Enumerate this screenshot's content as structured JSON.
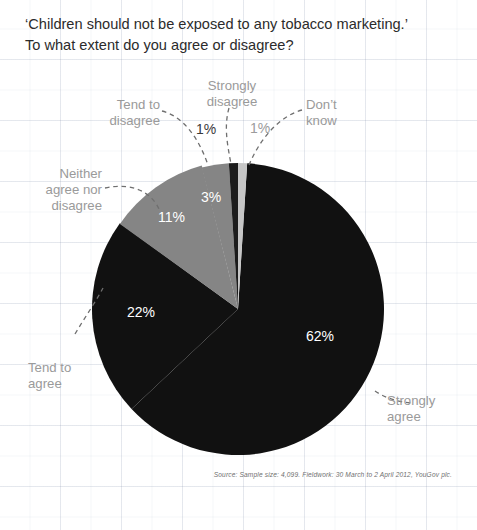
{
  "figure": {
    "width": 477,
    "height": 530,
    "background_color": "#ffffff",
    "grid_visible": true
  },
  "title": {
    "line1": "‘Children should not be exposed to any tobacco marketing.’",
    "line2": "To what extent do you agree or disagree?"
  },
  "source": {
    "text": "Source: Sample size: 4,099. Fieldwork: 30 March to 2 April 2012, YouGov plc."
  },
  "labels": {
    "strongly_disagree_l1": "Strongly",
    "strongly_disagree_l2": "disagree",
    "tend_to_disagree_l1": "Tend to",
    "tend_to_disagree_l2": "disagree",
    "dont_know_l1": "Don’t",
    "dont_know_l2": "know",
    "neither_l1": "Neither",
    "neither_l2": "agree nor",
    "neither_l3": "disagree",
    "tend_to_agree_l1": "Tend to",
    "tend_to_agree_l2": "agree",
    "strongly_agree_l1": "Strongly",
    "strongly_agree_l2": "agree"
  },
  "percent_labels": {
    "strongly_agree": "62%",
    "tend_to_agree": "22%",
    "neither": "11%",
    "tend_to_disagree": "3%",
    "strongly_disagree": "1%",
    "dont_know": "1%"
  },
  "chart_data": {
    "type": "pie",
    "title": "‘Children should not be exposed to any tobacco marketing.’ To what extent do you agree or disagree?",
    "xlabel": "",
    "ylabel": "",
    "legend_position": "none",
    "grid": true,
    "units": "percent",
    "start_angle_deg": 0,
    "direction": "clockwise",
    "center": {
      "x": 238,
      "y": 309
    },
    "radius": 146,
    "categories": [
      "Don’t know",
      "Strongly agree",
      "Tend to agree",
      "Neither agree nor disagree",
      "Tend to disagree",
      "Strongly disagree"
    ],
    "values": [
      1,
      62,
      22,
      11,
      3,
      1
    ],
    "colors": [
      "#c6c6c6",
      "#111111",
      "#111111",
      "#858585",
      "#858585",
      "#1c1c1c"
    ],
    "slices": [
      {
        "label": "Don’t know",
        "value": 1,
        "display": "1%",
        "color": "#c6c6c6",
        "start_deg": 0.0,
        "end_deg": 3.6
      },
      {
        "label": "Strongly agree",
        "value": 62,
        "display": "62%",
        "color": "#111111",
        "start_deg": 3.6,
        "end_deg": 226.8
      },
      {
        "label": "Tend to agree",
        "value": 22,
        "display": "22%",
        "color": "#111111",
        "start_deg": 226.8,
        "end_deg": 306.0
      },
      {
        "label": "Neither agree nor disagree",
        "value": 11,
        "display": "11%",
        "color": "#858585",
        "start_deg": 306.0,
        "end_deg": 345.6
      },
      {
        "label": "Tend to disagree",
        "value": 3,
        "display": "3%",
        "color": "#858585",
        "start_deg": 345.6,
        "end_deg": 356.4
      },
      {
        "label": "Strongly disagree",
        "value": 1,
        "display": "1%",
        "color": "#1c1c1c",
        "start_deg": 356.4,
        "end_deg": 360.0
      }
    ],
    "annotations": [
      "Source: Sample size: 4,099. Fieldwork: 30 March to 2 April 2012, YouGov plc."
    ]
  }
}
